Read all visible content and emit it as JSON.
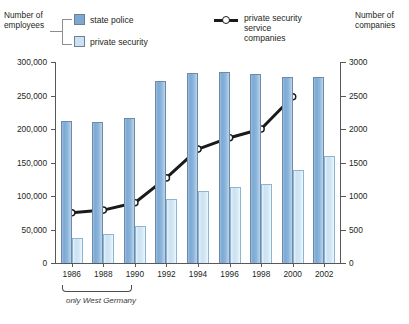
{
  "axes": {
    "left_title": "Number of\nemployees",
    "right_title": "Number of\ncompanies",
    "left_ticks": [
      "300,000",
      "250,000",
      "200,000",
      "150,000",
      "100,000",
      "50,000",
      "0"
    ],
    "right_ticks": [
      "3000",
      "2500",
      "2000",
      "1500",
      "1000",
      "500",
      "0"
    ]
  },
  "legend": {
    "state_police": "state police",
    "private_security": "private security",
    "companies": "private security\nservice\ncompanies"
  },
  "footnote": "only West Germany",
  "chart_data": {
    "type": "bar",
    "title": "",
    "xlabel": "",
    "ylabel": "Number of employees",
    "y2label": "Number of companies",
    "categories": [
      "1986",
      "1988",
      "1990",
      "1992",
      "1994",
      "1996",
      "1998",
      "2000",
      "2002"
    ],
    "ylim": [
      0,
      300000
    ],
    "y2lim": [
      0,
      3000
    ],
    "grid": false,
    "legend_position": "top",
    "series": [
      {
        "name": "state police",
        "type": "bar",
        "axis": "left",
        "color": "#7ba9d4",
        "values": [
          212000,
          211000,
          216000,
          271000,
          283000,
          285000,
          282000,
          278000,
          277000
        ]
      },
      {
        "name": "private security",
        "type": "bar",
        "axis": "left",
        "color": "#cae2f3",
        "values": [
          38000,
          44000,
          55000,
          96000,
          108000,
          114000,
          118000,
          139000,
          159000
        ]
      },
      {
        "name": "private security service companies",
        "type": "line",
        "axis": "right",
        "color": "#1a1a1a",
        "x": [
          "1986",
          "1988",
          "1990",
          "1992",
          "1994",
          "1996",
          "1998",
          "2000"
        ],
        "values": [
          750,
          790,
          900,
          1270,
          1700,
          1870,
          2000,
          2480
        ]
      }
    ]
  }
}
